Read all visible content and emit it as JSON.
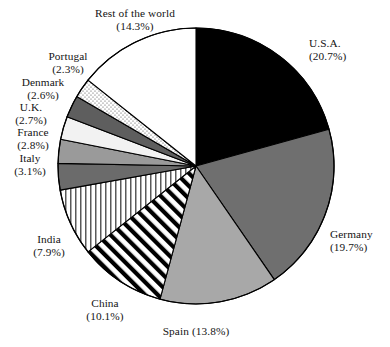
{
  "chart_data": {
    "type": "pie",
    "title": "",
    "subtitle": "",
    "xlabel": "",
    "ylabel": "",
    "legend_position": "none",
    "grid": false,
    "value_unit": "percent",
    "start_angle_deg": 0,
    "direction": "clockwise",
    "categories": [
      "U.S.A.",
      "Germany",
      "Spain",
      "China",
      "India",
      "Italy",
      "France",
      "U.K.",
      "Denmark",
      "Portugal",
      "Rest of the world"
    ],
    "values": [
      20.7,
      19.7,
      13.8,
      10.1,
      7.9,
      3.1,
      2.8,
      2.7,
      2.6,
      2.3,
      14.3
    ],
    "slices": [
      {
        "name": "U.S.A.",
        "percent": 20.7,
        "percent_label": "(20.7%)",
        "fill": "#000000",
        "pattern": "solid",
        "label_name": "U.S.A.",
        "label_x": 309,
        "label_y": 37,
        "align": "left",
        "one_line": false
      },
      {
        "name": "Germany",
        "percent": 19.7,
        "percent_label": "(19.7%)",
        "fill": "#6f6f6f",
        "pattern": "solid",
        "label_name": "Germany",
        "label_x": 330,
        "label_y": 228,
        "align": "left",
        "one_line": false
      },
      {
        "name": "Spain",
        "percent": 13.8,
        "percent_label": "(13.8%)",
        "fill": "#a8a8a8",
        "pattern": "solid",
        "label_name": "Spain",
        "label_x": 196,
        "label_y": 325,
        "align": "center",
        "one_line": true
      },
      {
        "name": "China",
        "percent": 10.1,
        "percent_label": "(10.1%)",
        "fill": "#ffffff",
        "pattern": "diagonal-stripes",
        "label_name": "China",
        "label_x": 105,
        "label_y": 297,
        "align": "center",
        "one_line": false
      },
      {
        "name": "India",
        "percent": 7.9,
        "percent_label": "(7.9%)",
        "fill": "#ffffff",
        "pattern": "vertical-stripes",
        "label_name": "India",
        "label_x": 49,
        "label_y": 233,
        "align": "center",
        "one_line": false
      },
      {
        "name": "Italy",
        "percent": 3.1,
        "percent_label": "(3.1%)",
        "fill": "#6b6b6b",
        "pattern": "solid",
        "label_name": "Italy",
        "label_x": 30,
        "label_y": 152,
        "align": "center",
        "one_line": false
      },
      {
        "name": "France",
        "percent": 2.8,
        "percent_label": "(2.8%)",
        "fill": "#9a9a9a",
        "pattern": "solid",
        "label_name": "France",
        "label_x": 33,
        "label_y": 126,
        "align": "center",
        "one_line": false
      },
      {
        "name": "U.K.",
        "percent": 2.7,
        "percent_label": "(2.7%)",
        "fill": "#f2f2f2",
        "pattern": "solid",
        "label_name": "U.K.",
        "label_x": 31,
        "label_y": 101,
        "align": "center",
        "one_line": false
      },
      {
        "name": "Denmark",
        "percent": 2.6,
        "percent_label": "(2.6%)",
        "fill": "#5e5e5e",
        "pattern": "solid",
        "label_name": "Denmark",
        "label_x": 43,
        "label_y": 76,
        "align": "center",
        "one_line": false
      },
      {
        "name": "Portugal",
        "percent": 2.3,
        "percent_label": "(2.3%)",
        "fill": "#ffffff",
        "pattern": "stipple-dots",
        "label_name": "Portugal",
        "label_x": 68,
        "label_y": 50,
        "align": "center",
        "one_line": false
      },
      {
        "name": "Rest of the world",
        "percent": 14.3,
        "percent_label": "(14.3%)",
        "fill": "#ffffff",
        "pattern": "solid",
        "label_name": "Rest of the world",
        "label_x": 135,
        "label_y": 7,
        "align": "center",
        "one_line": false
      }
    ],
    "geometry": {
      "center_x": 196,
      "center_y": 166,
      "radius": 138,
      "stroke": "#000000",
      "stroke_width": 1.1
    },
    "colors": {
      "background": "#ffffff",
      "text": "#141414",
      "outline": "#000000"
    }
  }
}
